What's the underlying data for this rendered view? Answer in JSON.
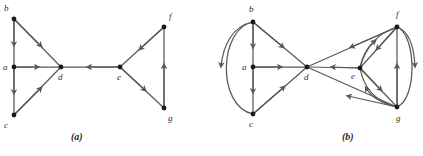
{
  "figure": {
    "background_color": "#ffffff",
    "ink_color": "#595959",
    "label_color": "#2d2d2d",
    "panels": [
      {
        "id": "panel-a",
        "caption": "(a)",
        "type": "directed-graph",
        "vertices": [
          {
            "id": "a",
            "label": "a",
            "x": 14,
            "y": 67,
            "label_x": 3,
            "label_y": 70
          },
          {
            "id": "b",
            "label": "b",
            "x": 14,
            "y": 19,
            "label_x": 4,
            "label_y": 11
          },
          {
            "id": "c",
            "label": "c",
            "x": 14,
            "y": 115,
            "label_x": 4,
            "label_y": 128
          },
          {
            "id": "d",
            "label": "d",
            "x": 61,
            "y": 67,
            "label_x": 58,
            "label_y": 80
          },
          {
            "id": "e",
            "label": "e",
            "x": 120,
            "y": 67,
            "label_x": 117,
            "label_y": 80
          },
          {
            "id": "f",
            "label": "f",
            "x": 164,
            "y": 27,
            "label_x": 169,
            "label_y": 19
          },
          {
            "id": "g",
            "label": "g",
            "x": 164,
            "y": 108,
            "label_x": 168,
            "label_y": 121
          }
        ],
        "edges": [
          {
            "from": "b",
            "to": "a",
            "shape": "straight"
          },
          {
            "from": "a",
            "to": "c",
            "shape": "straight"
          },
          {
            "from": "b",
            "to": "d",
            "shape": "straight"
          },
          {
            "from": "a",
            "to": "d",
            "shape": "straight"
          },
          {
            "from": "c",
            "to": "d",
            "shape": "straight"
          },
          {
            "from": "e",
            "to": "d",
            "shape": "straight"
          },
          {
            "from": "f",
            "to": "e",
            "shape": "straight"
          },
          {
            "from": "e",
            "to": "g",
            "shape": "straight"
          },
          {
            "from": "g",
            "to": "f",
            "shape": "straight"
          }
        ]
      },
      {
        "id": "panel-b",
        "caption": "(b)",
        "type": "directed-graph",
        "vertices": [
          {
            "id": "a",
            "label": "a",
            "x": 253,
            "y": 67,
            "label_x": 242,
            "label_y": 70
          },
          {
            "id": "b",
            "label": "b",
            "x": 253,
            "y": 22,
            "label_x": 249,
            "label_y": 12
          },
          {
            "id": "c",
            "label": "c",
            "x": 253,
            "y": 114,
            "label_x": 249,
            "label_y": 127
          },
          {
            "id": "d",
            "label": "d",
            "x": 307,
            "y": 67,
            "label_x": 304,
            "label_y": 80
          },
          {
            "id": "e",
            "label": "e",
            "x": 360,
            "y": 68,
            "label_x": 351,
            "label_y": 79
          },
          {
            "id": "f",
            "label": "f",
            "x": 397,
            "y": 27,
            "label_x": 396,
            "label_y": 17
          },
          {
            "id": "g",
            "label": "g",
            "x": 397,
            "y": 107,
            "label_x": 396,
            "label_y": 121
          }
        ],
        "edges": [
          {
            "from": "b",
            "to": "a",
            "shape": "straight"
          },
          {
            "from": "a",
            "to": "c",
            "shape": "straight"
          },
          {
            "from": "b",
            "to": "c",
            "shape": "curved-left"
          },
          {
            "from": "b",
            "to": "d",
            "shape": "straight"
          },
          {
            "from": "a",
            "to": "d",
            "shape": "straight"
          },
          {
            "from": "c",
            "to": "d",
            "shape": "straight"
          },
          {
            "from": "e",
            "to": "d",
            "shape": "straight"
          },
          {
            "from": "f",
            "to": "d",
            "shape": "straight"
          },
          {
            "from": "g",
            "to": "d",
            "shape": "straight"
          },
          {
            "from": "f",
            "to": "e",
            "shape": "straight"
          },
          {
            "from": "e",
            "to": "f",
            "shape": "curved"
          },
          {
            "from": "e",
            "to": "g",
            "shape": "straight"
          },
          {
            "from": "g",
            "to": "e",
            "shape": "curved"
          },
          {
            "from": "g",
            "to": "f",
            "shape": "straight"
          },
          {
            "from": "f",
            "to": "g",
            "shape": "curved-right"
          }
        ]
      }
    ]
  }
}
